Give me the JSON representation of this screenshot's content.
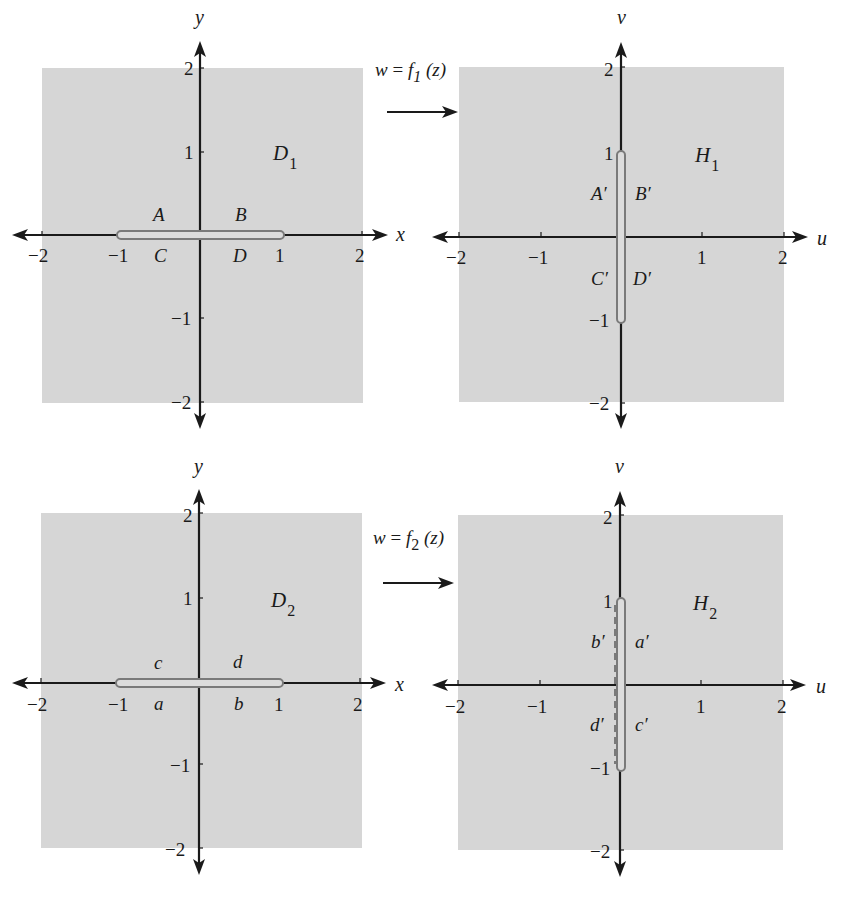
{
  "figure": {
    "panels": [
      {
        "id": "top-left",
        "plane": "z",
        "x_axis_label": "x",
        "y_axis_label": "y",
        "x_ticks": [
          "−2",
          "−1",
          "1",
          "2"
        ],
        "y_ticks": [
          "2",
          "1",
          "−1",
          "−2"
        ],
        "region_label": "D",
        "region_subscript": "1",
        "slit": "horizontal segment from −1 to 1 on real axis",
        "segment_labels": {
          "upper_left": "A",
          "upper_right": "B",
          "lower_left": "C",
          "lower_right": "D"
        }
      },
      {
        "id": "top-right",
        "plane": "w",
        "x_axis_label": "u",
        "y_axis_label": "v",
        "x_ticks": [
          "−2",
          "−1",
          "1",
          "2"
        ],
        "y_ticks": [
          "2",
          "1",
          "−1",
          "−2"
        ],
        "region_label": "H",
        "region_subscript": "1",
        "slit": "vertical segment from −i to i on imaginary axis",
        "segment_labels": {
          "upper_left": "A′",
          "upper_right": "B′",
          "lower_left": "C′",
          "lower_right": "D′"
        }
      },
      {
        "id": "bottom-left",
        "plane": "z",
        "x_axis_label": "x",
        "y_axis_label": "y",
        "x_ticks": [
          "−2",
          "−1",
          "1",
          "2"
        ],
        "y_ticks": [
          "2",
          "1",
          "−1",
          "−2"
        ],
        "region_label": "D",
        "region_subscript": "2",
        "slit": "horizontal segment from −1 to 1 on real axis",
        "segment_labels": {
          "upper_left": "c",
          "upper_right": "d",
          "lower_left": "a",
          "lower_right": "b"
        }
      },
      {
        "id": "bottom-right",
        "plane": "w",
        "x_axis_label": "u",
        "y_axis_label": "v",
        "x_ticks": [
          "−2",
          "−1",
          "1",
          "2"
        ],
        "y_ticks": [
          "2",
          "1",
          "−1",
          "−2"
        ],
        "region_label": "H",
        "region_subscript": "2",
        "slit": "vertical segment from −i to i on imaginary axis",
        "segment_labels": {
          "upper_left": "b′",
          "upper_right": "a′",
          "lower_left": "d′",
          "lower_right": "c′"
        }
      }
    ],
    "mappings": [
      {
        "lhs": "w",
        "eq": " = ",
        "func": "f",
        "func_subscript": "1",
        "arg": " (z)"
      },
      {
        "lhs": "w",
        "eq": " = ",
        "func": "f",
        "func_subscript": "2",
        "arg": " (z)"
      }
    ],
    "colors": {
      "region_fill": "#d6d6d6",
      "axis": "#1a1a1a",
      "slit_outline": "#7a7a7a"
    }
  }
}
